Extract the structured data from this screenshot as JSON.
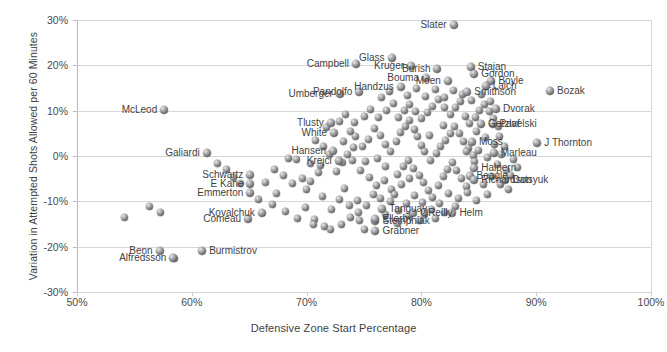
{
  "chart_data": {
    "type": "scatter",
    "title": "",
    "xlabel": "Defensive Zone Start Percentage",
    "ylabel": "Variation in Attempted Shots Allowed per 60 Minutes",
    "xlim": [
      50,
      100
    ],
    "ylim": [
      -30,
      30
    ],
    "xticks": [
      "50%",
      "60%",
      "70%",
      "80%",
      "90%",
      "100%"
    ],
    "xtick_values": [
      50,
      60,
      70,
      80,
      90,
      100
    ],
    "yticks": [
      "30%",
      "20%",
      "10%",
      "0%",
      "-10%",
      "-20%",
      "-30%"
    ],
    "ytick_values": [
      30,
      20,
      10,
      0,
      -10,
      -20,
      -30
    ],
    "grid": true,
    "legend": "none",
    "marker_color": "#6b6b6e",
    "labeled_points": [
      {
        "label": "Slater",
        "x": 82.8,
        "y": 28.8,
        "side": "r"
      },
      {
        "label": "Campbell",
        "x": 74.3,
        "y": 20.4,
        "side": "r"
      },
      {
        "label": "Glass",
        "x": 77.4,
        "y": 21.6,
        "side": "r"
      },
      {
        "label": "Kruger",
        "x": 79.1,
        "y": 19.9,
        "side": "r"
      },
      {
        "label": "Burish",
        "x": 81.4,
        "y": 19.3,
        "side": "r"
      },
      {
        "label": "Stajan",
        "x": 84.3,
        "y": 19.6,
        "side": "l"
      },
      {
        "label": "Gordon",
        "x": 84.6,
        "y": 18.0,
        "side": "l"
      },
      {
        "label": "Bouma",
        "x": 80.4,
        "y": 17.2,
        "side": "r"
      },
      {
        "label": "Moen",
        "x": 82.3,
        "y": 16.5,
        "side": "r"
      },
      {
        "label": "Boyle",
        "x": 86.1,
        "y": 16.6,
        "side": "l"
      },
      {
        "label": "Laich",
        "x": 85.6,
        "y": 15.5,
        "side": "l"
      },
      {
        "label": "Handzus",
        "x": 78.2,
        "y": 15.3,
        "side": "r"
      },
      {
        "label": "Smithson",
        "x": 84.0,
        "y": 14.2,
        "side": "l"
      },
      {
        "label": "Umberger",
        "x": 72.9,
        "y": 13.6,
        "side": "r"
      },
      {
        "label": "Pandolfo",
        "x": 74.6,
        "y": 14.1,
        "side": "r"
      },
      {
        "label": "Bozak",
        "x": 91.2,
        "y": 14.4,
        "side": "l"
      },
      {
        "label": "McLeod",
        "x": 57.6,
        "y": 10.1,
        "side": "r"
      },
      {
        "label": "Dvorak",
        "x": 86.5,
        "y": 10.4,
        "side": "l"
      },
      {
        "label": "Tlusty",
        "x": 72.1,
        "y": 7.2,
        "side": "r"
      },
      {
        "label": "Getzlaf",
        "x": 85.2,
        "y": 7.0,
        "side": "l"
      },
      {
        "label": "Pavelski",
        "x": 86.2,
        "y": 7.0,
        "side": "l"
      },
      {
        "label": "White",
        "x": 72.4,
        "y": 5.1,
        "side": "r"
      },
      {
        "label": "Moss",
        "x": 84.4,
        "y": 3.0,
        "side": "l"
      },
      {
        "label": "Marleau",
        "x": 86.3,
        "y": 0.6,
        "side": "l"
      },
      {
        "label": "J Thornton",
        "x": 90.1,
        "y": 2.8,
        "side": "l"
      },
      {
        "label": "Galiardi",
        "x": 61.3,
        "y": 0.6,
        "side": "r"
      },
      {
        "label": "Hansen",
        "x": 72.3,
        "y": 1.1,
        "side": "r"
      },
      {
        "label": "Krejci",
        "x": 72.8,
        "y": -1.2,
        "side": "r"
      },
      {
        "label": "Halpern",
        "x": 84.6,
        "y": -2.6,
        "side": "l"
      },
      {
        "label": "Beagle",
        "x": 84.2,
        "y": -4.4,
        "side": "l"
      },
      {
        "label": "Richardson",
        "x": 84.6,
        "y": -5.3,
        "side": "l"
      },
      {
        "label": "Datsyuk",
        "x": 87.3,
        "y": -5.3,
        "side": "l"
      },
      {
        "label": "Schwartz",
        "x": 65.1,
        "y": -4.1,
        "side": "r"
      },
      {
        "label": "E Kane",
        "x": 65.1,
        "y": -6.2,
        "side": "r"
      },
      {
        "label": "Emmerton",
        "x": 65.1,
        "y": -8.2,
        "side": "r"
      },
      {
        "label": "Kovalchuk",
        "x": 66.1,
        "y": -12.5,
        "side": "r"
      },
      {
        "label": "Comeau",
        "x": 64.9,
        "y": -14.0,
        "side": "r"
      },
      {
        "label": "Tanguay",
        "x": 76.6,
        "y": -11.8,
        "side": "l"
      },
      {
        "label": "Stempniak",
        "x": 76.0,
        "y": -14.4,
        "side": "l"
      },
      {
        "label": "OReilly",
        "x": 79.3,
        "y": -12.5,
        "side": "l"
      },
      {
        "label": "Helm",
        "x": 82.7,
        "y": -12.6,
        "side": "l"
      },
      {
        "label": "Ellerby",
        "x": 76.0,
        "y": -13.9,
        "side": "l"
      },
      {
        "label": "Grabner",
        "x": 76.0,
        "y": -16.5,
        "side": "l"
      },
      {
        "label": "Benn",
        "x": 57.2,
        "y": -20.9,
        "side": "r"
      },
      {
        "label": "Burmistrov",
        "x": 60.9,
        "y": -21.0,
        "side": "l"
      },
      {
        "label": "Alfredsson",
        "x": 58.4,
        "y": -22.6,
        "side": "r"
      }
    ],
    "unlabeled_points": [
      [
        54.1,
        -13.5
      ],
      [
        56.3,
        -11.2
      ],
      [
        57.3,
        -12.4
      ],
      [
        58.5,
        -22.6
      ],
      [
        68.4,
        -0.5
      ],
      [
        69.1,
        -0.8
      ],
      [
        70.3,
        -1.6
      ],
      [
        71.0,
        -3.6
      ],
      [
        69.6,
        -5.0
      ],
      [
        70.3,
        -5.6
      ],
      [
        67.4,
        -8.2
      ],
      [
        69.9,
        -11.4
      ],
      [
        70.7,
        -13.9
      ],
      [
        71.6,
        -15.5
      ],
      [
        72.1,
        -16.3
      ],
      [
        73.3,
        -7.2
      ],
      [
        74.4,
        -9.9
      ],
      [
        73.8,
        -13.6
      ],
      [
        75.0,
        -16.2
      ],
      [
        74.0,
        -0.9
      ],
      [
        75.1,
        -1.3
      ],
      [
        76.2,
        -0.6
      ],
      [
        76.9,
        -2.4
      ],
      [
        73.2,
        3.1
      ],
      [
        73.8,
        5.4
      ],
      [
        74.3,
        4.4
      ],
      [
        74.9,
        2.0
      ],
      [
        75.4,
        3.6
      ],
      [
        75.9,
        6.0
      ],
      [
        76.4,
        4.6
      ],
      [
        76.9,
        2.6
      ],
      [
        77.3,
        1.1
      ],
      [
        77.8,
        3.2
      ],
      [
        78.2,
        5.1
      ],
      [
        78.6,
        6.6
      ],
      [
        79.0,
        7.9
      ],
      [
        79.4,
        5.9
      ],
      [
        79.7,
        4.2
      ],
      [
        80.0,
        2.3
      ],
      [
        80.3,
        0.9
      ],
      [
        74.7,
        -3.3
      ],
      [
        75.5,
        -4.8
      ],
      [
        76.1,
        -6.6
      ],
      [
        76.8,
        -5.3
      ],
      [
        77.4,
        -7.3
      ],
      [
        77.9,
        -4.0
      ],
      [
        78.4,
        -2.4
      ],
      [
        78.9,
        -0.9
      ],
      [
        79.3,
        -2.8
      ],
      [
        79.8,
        -4.3
      ],
      [
        80.2,
        -5.9
      ],
      [
        80.6,
        -7.6
      ],
      [
        81.0,
        -9.2
      ],
      [
        81.5,
        -6.4
      ],
      [
        81.9,
        -4.6
      ],
      [
        82.3,
        -3.0
      ],
      [
        82.7,
        -1.4
      ],
      [
        83.1,
        -3.1
      ],
      [
        83.5,
        -5.0
      ],
      [
        83.9,
        -6.8
      ],
      [
        80.8,
        -1.0
      ],
      [
        81.3,
        0.5
      ],
      [
        81.7,
        2.0
      ],
      [
        82.1,
        3.5
      ],
      [
        82.5,
        5.0
      ],
      [
        82.9,
        6.4
      ],
      [
        83.3,
        4.9
      ],
      [
        83.7,
        3.3
      ],
      [
        84.1,
        1.7
      ],
      [
        84.5,
        0.2
      ],
      [
        78.0,
        8.5
      ],
      [
        78.5,
        10.0
      ],
      [
        79.0,
        11.4
      ],
      [
        79.5,
        9.8
      ],
      [
        80.0,
        8.2
      ],
      [
        80.5,
        9.6
      ],
      [
        81.0,
        11.0
      ],
      [
        81.5,
        12.4
      ],
      [
        82.0,
        10.8
      ],
      [
        82.5,
        9.2
      ],
      [
        83.0,
        10.6
      ],
      [
        83.4,
        12.0
      ],
      [
        83.8,
        8.8
      ],
      [
        84.2,
        7.2
      ],
      [
        84.7,
        8.6
      ],
      [
        85.1,
        10.0
      ],
      [
        85.5,
        11.4
      ],
      [
        85.9,
        9.8
      ],
      [
        86.3,
        8.2
      ],
      [
        86.7,
        6.6
      ],
      [
        71.5,
        2.2
      ],
      [
        72.0,
        0.4
      ],
      [
        71.2,
        -2.1
      ],
      [
        72.6,
        -3.4
      ],
      [
        73.1,
        -1.5
      ],
      [
        73.6,
        0.3
      ],
      [
        74.1,
        1.8
      ],
      [
        70.8,
        3.5
      ],
      [
        71.7,
        6.2
      ],
      [
        72.9,
        7.6
      ],
      [
        73.4,
        9.1
      ],
      [
        74.2,
        7.4
      ],
      [
        75.0,
        8.8
      ],
      [
        75.6,
        10.2
      ],
      [
        76.3,
        8.6
      ],
      [
        77.0,
        10.1
      ],
      [
        77.6,
        11.5
      ],
      [
        76.5,
        12.8
      ],
      [
        77.2,
        14.2
      ],
      [
        78.8,
        13.4
      ],
      [
        79.6,
        14.8
      ],
      [
        80.4,
        13.2
      ],
      [
        81.2,
        14.6
      ],
      [
        82.0,
        13.0
      ],
      [
        82.8,
        14.4
      ],
      [
        83.6,
        13.6
      ],
      [
        84.4,
        12.2
      ],
      [
        85.2,
        13.6
      ],
      [
        86.0,
        12.0
      ],
      [
        84.8,
        5.4
      ],
      [
        85.6,
        4.0
      ],
      [
        86.4,
        2.6
      ],
      [
        85.0,
        1.2
      ],
      [
        85.8,
        -0.4
      ],
      [
        86.6,
        -1.8
      ],
      [
        87.0,
        0.4
      ],
      [
        87.4,
        -3.2
      ],
      [
        86.1,
        -4.6
      ],
      [
        85.4,
        -6.2
      ],
      [
        84.0,
        -8.0
      ],
      [
        83.2,
        -9.4
      ],
      [
        82.4,
        -8.2
      ],
      [
        81.6,
        -10.4
      ],
      [
        80.9,
        -11.8
      ],
      [
        80.1,
        -10.2
      ],
      [
        79.4,
        -8.8
      ],
      [
        78.7,
        -10.5
      ],
      [
        78.0,
        -12.0
      ],
      [
        77.3,
        -10.0
      ],
      [
        75.8,
        -8.4
      ],
      [
        75.2,
        -11.0
      ],
      [
        74.5,
        -12.4
      ],
      [
        73.7,
        -11.0
      ],
      [
        72.9,
        -9.6
      ],
      [
        72.2,
        -11.8
      ],
      [
        71.4,
        -9.0
      ],
      [
        70.0,
        -7.4
      ],
      [
        68.8,
        -6.0
      ],
      [
        68.0,
        -4.4
      ],
      [
        67.2,
        -3.0
      ],
      [
        66.4,
        -5.8
      ],
      [
        65.8,
        -9.6
      ],
      [
        67.0,
        -10.8
      ],
      [
        68.2,
        -12.2
      ],
      [
        69.2,
        -13.8
      ],
      [
        70.6,
        -15.0
      ],
      [
        73.0,
        -15.1
      ],
      [
        74.6,
        -14.3
      ],
      [
        78.3,
        -6.2
      ],
      [
        79.0,
        -5.0
      ],
      [
        77.7,
        -8.6
      ],
      [
        76.4,
        -9.3
      ],
      [
        62.2,
        -1.6
      ],
      [
        63.0,
        -3.0
      ],
      [
        63.6,
        -4.8
      ],
      [
        64.2,
        -6.0
      ],
      [
        86.9,
        -6.2
      ],
      [
        87.6,
        -7.4
      ],
      [
        85.8,
        -8.6
      ],
      [
        84.8,
        -9.8
      ],
      [
        83.0,
        -11.2
      ],
      [
        82.0,
        -12.5
      ],
      [
        81.2,
        -13.8
      ],
      [
        80.3,
        -12.8
      ],
      [
        79.8,
        -14.2
      ],
      [
        78.9,
        -13.2
      ],
      [
        77.9,
        -14.8
      ],
      [
        76.9,
        -13.0
      ],
      [
        80.7,
        4.6
      ],
      [
        81.9,
        6.8
      ],
      [
        83.9,
        1.0
      ],
      [
        84.6,
        -1.2
      ],
      [
        86.8,
        4.2
      ],
      [
        87.2,
        2.0
      ],
      [
        88.0,
        -0.8
      ],
      [
        87.8,
        -4.4
      ],
      [
        88.4,
        -2.6
      ]
    ]
  }
}
